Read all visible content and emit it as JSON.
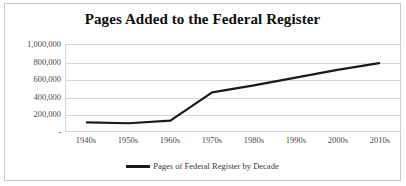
{
  "chart_data": {
    "type": "line",
    "title": "Pages Added to the Federal Register",
    "xlabel": "",
    "ylabel": "",
    "categories": [
      "1940s",
      "1950s",
      "1960s",
      "1970s",
      "1980s",
      "1990s",
      "2000s",
      "2010s"
    ],
    "series": [
      {
        "name": "Pages of Federal Register by Decade",
        "values": [
          100000,
          90000,
          120000,
          450000,
          530000,
          620000,
          710000,
          790000
        ],
        "color": "#1a1a1a"
      }
    ],
    "ylim": [
      0,
      1000000
    ],
    "ytick_values": [
      1000000,
      800000,
      600000,
      400000,
      200000,
      0
    ],
    "ytick_labels": [
      "1,000,000",
      "800,000",
      "600,000",
      "400,000",
      "200,000",
      "-"
    ],
    "grid": "horizontal",
    "legend_position": "bottom",
    "legend_entries": [
      "Pages of Federal Register by Decade"
    ]
  },
  "title": "Pages Added to the Federal Register",
  "legend": {
    "label": "Pages of Federal Register by Decade"
  }
}
